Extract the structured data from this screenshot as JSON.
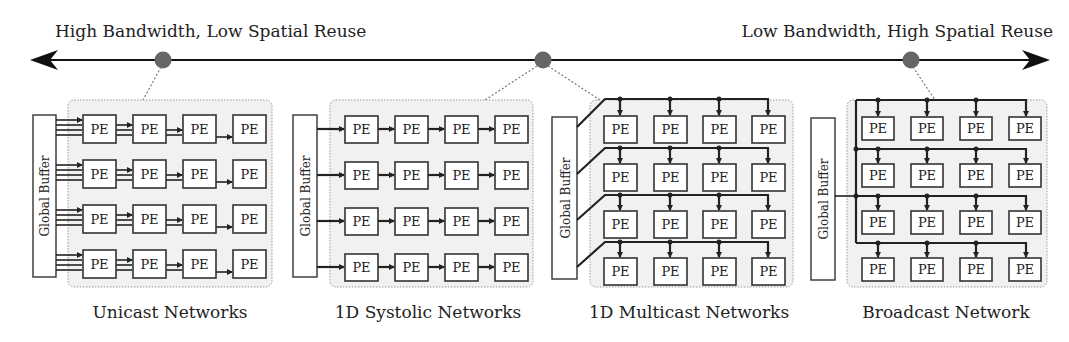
{
  "axis": {
    "left_label": "High Bandwidth, Low Spatial Reuse",
    "right_label": "Low Bandwidth, High Spatial Reuse",
    "dot_color": "#666666",
    "line_color": "#111111"
  },
  "panels": [
    {
      "id": "unicast",
      "label": "Unicast Networks",
      "buffer_label": "Global Buffer",
      "pe_label": "PE",
      "rows": 4,
      "cols": 4
    },
    {
      "id": "systolic",
      "label": "1D Systolic Networks",
      "buffer_label": "Global Buffer",
      "pe_label": "PE",
      "rows": 4,
      "cols": 4
    },
    {
      "id": "multicast",
      "label": "1D Multicast Networks",
      "buffer_label": "Global Buffer",
      "pe_label": "PE",
      "rows": 4,
      "cols": 4
    },
    {
      "id": "broadcast",
      "label": "Broadcast Network",
      "buffer_label": "Global Buffer",
      "pe_label": "PE",
      "rows": 4,
      "cols": 4
    }
  ]
}
